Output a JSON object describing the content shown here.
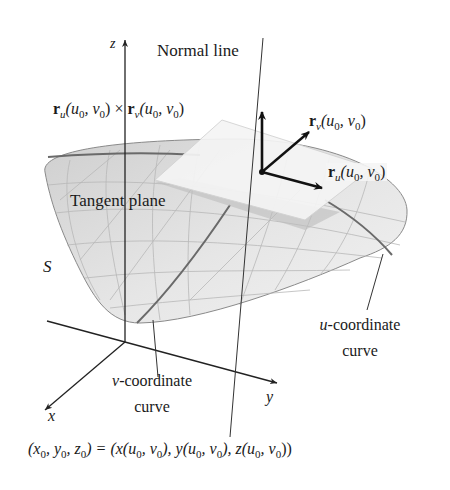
{
  "figure": {
    "labels": {
      "z_axis": "z",
      "x_axis": "x",
      "y_axis": "y",
      "normal_line": "Normal line",
      "tangent_plane": "Tangent plane",
      "surface": "S",
      "u_curve_line1": "-coordinate",
      "u_curve_var": "u",
      "u_curve_line2": "curve",
      "v_curve_line1": "-coordinate",
      "v_curve_var": "v",
      "v_curve_line2": "curve"
    },
    "vectors": {
      "cross": {
        "r": "r",
        "sub1": "u",
        "args1_a": "(u",
        "args1_b": "0",
        "args1_c": ", v",
        "args1_d": "0",
        "args1_e": ")",
        "times": " × ",
        "sub2": "v",
        "args2_a": "(u",
        "args2_b": "0",
        "args2_c": ", v",
        "args2_d": "0",
        "args2_e": ")"
      },
      "rv": {
        "r": "r",
        "sub": "v",
        "a": "(u",
        "b": "0",
        "c": ", v",
        "d": "0",
        "e": ")"
      },
      "ru": {
        "r": "r",
        "sub": "u",
        "a": "(u",
        "b": "0",
        "c": ", v",
        "d": "0",
        "e": ")"
      }
    },
    "point_equation": {
      "p1": "(x",
      "s1": "0",
      "p2": ", y",
      "s2": "0",
      "p3": ", z",
      "s3": "0",
      "p4": ") = (x(u",
      "s4": "0",
      "p5": ", v",
      "s5": "0",
      "p6": "), y(u",
      "s6": "0",
      "p7": ", v",
      "s7": "0",
      "p8": "), z(u",
      "s8": "0",
      "p9": ", v",
      "s9": "0",
      "p10": "))"
    },
    "colors": {
      "surface_fill": "#d9d9d9",
      "surface_light": "#eeeeee",
      "plane_fill": "#f4f4f4",
      "grid": "#b5b5b5",
      "coord_curve": "#6a6a6a",
      "axis": "#222222",
      "vector": "#111111"
    }
  }
}
